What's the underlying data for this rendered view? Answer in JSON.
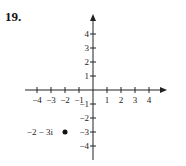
{
  "problem": {
    "number": "19."
  },
  "chart_data": {
    "type": "scatter",
    "title": "",
    "xlabel": "",
    "ylabel": "",
    "xlim": [
      -4.5,
      4.5
    ],
    "ylim": [
      -4.5,
      4.5
    ],
    "grid": false,
    "x_ticks": [
      -4,
      -3,
      -2,
      -1,
      1,
      2,
      3,
      4
    ],
    "y_ticks": [
      4,
      3,
      2,
      1,
      -1,
      -2,
      -3,
      -4
    ],
    "x_tick_labels": [
      "−4",
      "−3",
      "−2",
      "−1",
      "1",
      "2",
      "3",
      "4"
    ],
    "y_tick_labels": [
      "4",
      "3",
      "2",
      "1",
      "−1",
      "−2",
      "−3",
      "−4"
    ],
    "points": [
      {
        "x": -2,
        "y": -3,
        "label": "−2 − 3i"
      }
    ]
  }
}
